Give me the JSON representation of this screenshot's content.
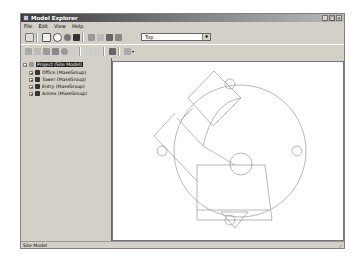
{
  "window": {
    "title": "Model Explorer",
    "controls": {
      "minimize": "_",
      "maximize": "□",
      "close": "×"
    }
  },
  "menu": {
    "items": [
      "File",
      "Edit",
      "View",
      "Help"
    ]
  },
  "toolbar1": {
    "icons": [
      "save-icon",
      "copy-view-icon",
      "camera-icon",
      "shade-icon",
      "mass-icon",
      "pan-icon",
      "zoom-icon",
      "render-icon",
      "layers-icon"
    ],
    "view_select": {
      "value": "Top"
    }
  },
  "toolbar2": {
    "icons": [
      "undo-icon",
      "redo-icon",
      "cut-icon",
      "copy-icon",
      "paste-icon",
      "delete-icon",
      "add-icon",
      "remove-icon",
      "properties-icon",
      "settings-icon"
    ]
  },
  "tree": {
    "root": {
      "label": "Project (Site Model)",
      "expander": "−"
    },
    "children": [
      {
        "label": "Office (MassGroup)",
        "expander": "+"
      },
      {
        "label": "Tower (MassGroup)",
        "expander": "+"
      },
      {
        "label": "Entry (MassGroup)",
        "expander": "+"
      },
      {
        "label": "Annex (MassGroup)",
        "expander": "+"
      }
    ]
  },
  "status": {
    "text": "Site Model"
  },
  "colors": {
    "line": "#888888",
    "title_dark": "#3a3a3a",
    "selection": "#222222"
  }
}
